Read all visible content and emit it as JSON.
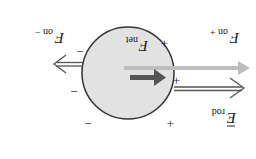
{
  "diagram": {
    "orientation": "rotated-180",
    "labels": {
      "f_net": "F",
      "f_net_sub": "net",
      "f_on_plus": "F",
      "f_on_plus_sub": "on +",
      "f_on_minus": "F",
      "f_on_minus_sub": "on −",
      "e_rod": "E",
      "e_rod_sub": "rod"
    },
    "charges": {
      "plus": [
        "+",
        "+",
        "+"
      ],
      "minus": [
        "−",
        "−",
        "−"
      ]
    },
    "colors": {
      "sphere_fill": "#e2e2e2",
      "sphere_stroke": "#333333",
      "force_arrow": "#555555",
      "field_arrow": "#bdbdbd",
      "net_arrow": "#555555"
    }
  }
}
